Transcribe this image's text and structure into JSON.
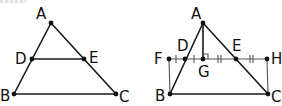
{
  "figures": [
    {
      "id": "left",
      "description": "Triangle ABC with segment DE connecting points on AB and AC",
      "points": {
        "A": {
          "label": "A",
          "x": 51,
          "y": 23
        },
        "D": {
          "label": "D",
          "x": 32,
          "y": 59
        },
        "E": {
          "label": "E",
          "x": 84,
          "y": 59
        },
        "B": {
          "label": "B",
          "x": 14,
          "y": 94
        },
        "C": {
          "label": "C",
          "x": 116,
          "y": 94
        }
      },
      "segments": [
        "AB",
        "AC",
        "BC",
        "DE"
      ]
    },
    {
      "id": "right",
      "description": "Triangle ABC with line FH through D and E, altitude AG perpendicular to FH, rectangle FHCB; FD = DG (single ticks), GE = EH (double ticks)",
      "points": {
        "A": {
          "label": "A",
          "x": 203,
          "y": 23
        },
        "F": {
          "label": "F",
          "x": 169,
          "y": 59
        },
        "D": {
          "label": "D",
          "x": 185,
          "y": 59
        },
        "G": {
          "label": "G",
          "x": 203,
          "y": 59
        },
        "E": {
          "label": "E",
          "x": 236,
          "y": 59
        },
        "H": {
          "label": "H",
          "x": 267,
          "y": 59
        },
        "B": {
          "label": "B",
          "x": 170,
          "y": 94
        },
        "C": {
          "label": "C",
          "x": 268,
          "y": 94
        }
      },
      "segments": [
        "AB",
        "AC",
        "BC",
        "FH",
        "AG",
        "FB",
        "HC"
      ],
      "marks": {
        "right_angle_at": "G",
        "single_ticks": [
          "FD",
          "DG"
        ],
        "double_ticks": [
          "GE",
          "EH"
        ]
      }
    }
  ],
  "labels": {
    "left": {
      "A": "A",
      "D": "D",
      "E": "E",
      "B": "B",
      "C": "C"
    },
    "right": {
      "A": "A",
      "F": "F",
      "D": "D",
      "G": "G",
      "E": "E",
      "H": "H",
      "B": "B",
      "C": "C"
    }
  },
  "colors": {
    "line": "#1a1a1a",
    "thin_line": "#555555",
    "point": "#111111",
    "background": "#ffffff"
  }
}
